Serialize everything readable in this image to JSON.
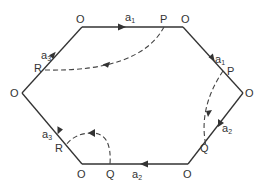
{
  "diagram": {
    "colors": {
      "line": "#333333",
      "dashed": "#444444",
      "text": "#333333",
      "background": "#ffffff"
    },
    "vertices": {
      "top_left": {
        "label": "O",
        "x": 82,
        "y": 27
      },
      "top_right": {
        "label": "O",
        "x": 183,
        "y": 27
      },
      "right": {
        "label": "O",
        "x": 243,
        "y": 93
      },
      "bottom_right": {
        "label": "O",
        "x": 188,
        "y": 164
      },
      "bottom_left": {
        "label": "O",
        "x": 82,
        "y": 164
      },
      "left": {
        "label": "O",
        "x": 22,
        "y": 93
      }
    },
    "points": {
      "p_top": {
        "label": "P",
        "x": 164,
        "y": 27
      },
      "p_right": {
        "label": "P",
        "x": 223,
        "y": 71
      },
      "q_right": {
        "label": "Q",
        "x": 204,
        "y": 145
      },
      "q_bottom": {
        "label": "Q",
        "x": 110,
        "y": 164
      },
      "r_upper": {
        "label": "R",
        "x": 45,
        "y": 66
      },
      "r_lower": {
        "label": "R",
        "x": 60,
        "y": 140
      }
    },
    "vector_labels": {
      "a1_top": {
        "base": "a",
        "sub": "1"
      },
      "a1_right": {
        "base": "a",
        "sub": "1"
      },
      "a2_right": {
        "base": "a",
        "sub": "2"
      },
      "a2_bottom": {
        "base": "a",
        "sub": "2"
      },
      "a3_upper": {
        "base": "a",
        "sub": "3"
      },
      "a3_lower": {
        "base": "a",
        "sub": "3"
      }
    },
    "dashed_paths": [
      {
        "from": "P (top edge)",
        "to": "R (upper-left edge)",
        "direction": "P to R"
      },
      {
        "from": "P (upper-right edge)",
        "to": "Q (lower-right edge)",
        "direction": "P to Q"
      },
      {
        "from": "Q (bottom edge)",
        "to": "R (lower-left edge)",
        "direction": "Q to R"
      }
    ]
  }
}
